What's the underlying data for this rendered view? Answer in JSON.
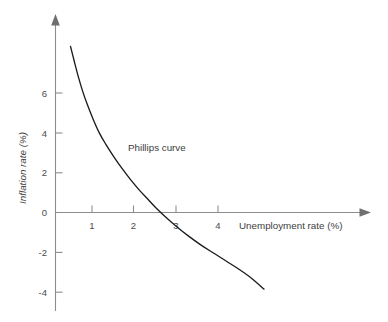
{
  "chart_data": {
    "type": "line",
    "title": "",
    "subtitle": "",
    "xlabel": "Unemployment rate (%)",
    "ylabel": "Inflation rate (%)",
    "xlim": [
      0,
      4.8
    ],
    "ylim": [
      -4.9,
      8.4
    ],
    "grid": false,
    "legend": null,
    "xticks": [
      1,
      2,
      3,
      4
    ],
    "xtick_labels": [
      "1",
      "2",
      "3",
      "4"
    ],
    "yticks": [
      6,
      4,
      2,
      0,
      -2,
      -4
    ],
    "ytick_labels": [
      "6",
      "4",
      "2",
      "0",
      "-2",
      "-4"
    ],
    "annotations": [
      {
        "text": "Phillips curve",
        "x": 1.75,
        "y": 3.2
      }
    ],
    "series": [
      {
        "name": "Phillips curve",
        "color": "#1c1c1c",
        "x": [
          0.36,
          0.45,
          0.55,
          0.65,
          0.75,
          0.9,
          1.05,
          1.2,
          1.4,
          1.6,
          1.8,
          2.0,
          2.2,
          2.4,
          2.6,
          2.9,
          3.2,
          3.5,
          3.8,
          4.1,
          4.4,
          4.7,
          5.0
        ],
        "y": [
          8.35,
          7.6,
          6.8,
          6.1,
          5.5,
          4.7,
          4.0,
          3.45,
          2.8,
          2.2,
          1.65,
          1.15,
          0.7,
          0.25,
          -0.15,
          -0.7,
          -1.2,
          -1.65,
          -2.05,
          -2.45,
          -2.85,
          -3.3,
          -3.85
        ]
      }
    ]
  },
  "axes": {
    "x_axis_name": "unemployment-rate-axis",
    "y_axis_name": "inflation-rate-axis",
    "x_arrow": "arrow-right-icon",
    "y_arrow": "arrow-up-icon"
  }
}
